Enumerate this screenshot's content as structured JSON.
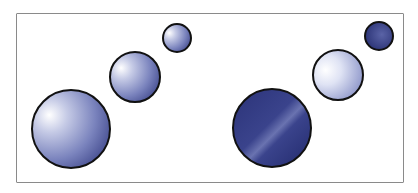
{
  "diagram": {
    "colors": {
      "dark_blue": "#2b3378",
      "mid_blue": "#6c76b4",
      "light": "#ffffff",
      "outline": "#111111"
    },
    "groups": [
      {
        "name": "left-group",
        "spheres": [
          {
            "cx": 71,
            "cy": 129,
            "r": 39,
            "style": "light"
          },
          {
            "cx": 135,
            "cy": 77,
            "r": 25,
            "style": "light"
          },
          {
            "cx": 177,
            "cy": 38,
            "r": 14,
            "style": "light"
          }
        ]
      },
      {
        "name": "right-group",
        "spheres": [
          {
            "cx": 272,
            "cy": 128,
            "r": 39,
            "style": "dark"
          },
          {
            "cx": 338,
            "cy": 75,
            "r": 25,
            "style": "pale"
          },
          {
            "cx": 379,
            "cy": 36,
            "r": 14,
            "style": "dark"
          }
        ]
      }
    ]
  }
}
